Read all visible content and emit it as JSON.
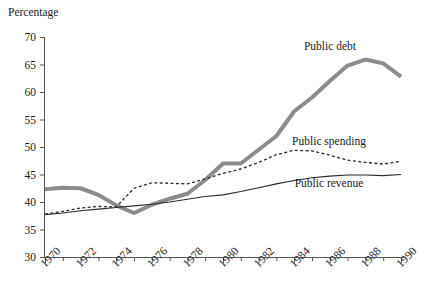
{
  "chart_data": {
    "type": "line",
    "title": "",
    "ylabel": "Percentage",
    "xlabel": "",
    "grid": false,
    "legend_position": "inline-right",
    "xlim": [
      1970,
      1990
    ],
    "ylim": [
      30,
      70
    ],
    "yticks": [
      30,
      35,
      40,
      45,
      50,
      55,
      60,
      65,
      70
    ],
    "xticks": [
      1970,
      1972,
      1974,
      1976,
      1978,
      1980,
      1982,
      1984,
      1986,
      1988,
      1990
    ],
    "x": [
      1970,
      1971,
      1972,
      1973,
      1974,
      1975,
      1976,
      1977,
      1978,
      1979,
      1980,
      1981,
      1982,
      1983,
      1984,
      1985,
      1986,
      1987,
      1988,
      1989,
      1990
    ],
    "series": [
      {
        "name": "Public debt",
        "style": "thick-gray-solid",
        "color": "#8c8c8c",
        "values": [
          42.3,
          42.6,
          42.5,
          41.3,
          39.4,
          38.0,
          39.5,
          40.6,
          41.5,
          44.0,
          47.0,
          47.0,
          49.5,
          52.0,
          56.5,
          59.0,
          62.0,
          64.8,
          65.9,
          65.2,
          62.8
        ]
      },
      {
        "name": "Public spending",
        "style": "dashed",
        "color": "#2b2b2b",
        "values": [
          37.8,
          38.3,
          38.9,
          39.2,
          39.1,
          42.5,
          43.5,
          43.4,
          43.3,
          44.2,
          45.2,
          46.0,
          47.2,
          48.6,
          49.4,
          49.3,
          48.5,
          47.6,
          47.2,
          46.9,
          47.4
        ]
      },
      {
        "name": "Public revenue",
        "style": "thin-solid",
        "color": "#2b2b2b",
        "values": [
          37.7,
          38.0,
          38.4,
          38.7,
          39.0,
          39.3,
          39.6,
          40.0,
          40.5,
          41.0,
          41.3,
          41.9,
          42.6,
          43.3,
          43.9,
          44.4,
          44.7,
          44.9,
          44.9,
          44.8,
          45.0
        ]
      }
    ],
    "annotations": [
      {
        "text": "Public debt",
        "series": "Public debt",
        "x_px": 330,
        "y_px": 50
      },
      {
        "text": "Public spending",
        "series": "Public spending",
        "x_px": 329,
        "y_px": 145
      },
      {
        "text": "Public revenue",
        "series": "Public revenue",
        "x_px": 329,
        "y_px": 187
      }
    ]
  }
}
